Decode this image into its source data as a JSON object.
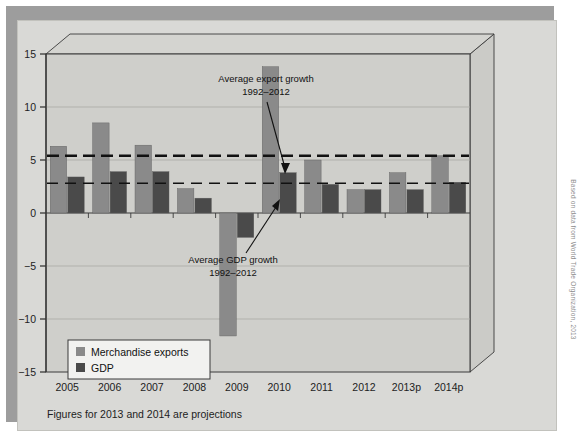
{
  "figure": {
    "note": "Figures for 2013 and 2014 are projections",
    "credit": "Based on data from World Trade Organization, 2013"
  },
  "annotations": {
    "export_growth": {
      "line1": "Average export growth",
      "line2": "1992–2012"
    },
    "gdp_growth": {
      "line1": "Average GDP growth",
      "line2": "1992–2012"
    }
  },
  "legend": {
    "items": [
      {
        "label": "Merchandise exports",
        "color": "#8a8a8a"
      },
      {
        "label": "GDP",
        "color": "#4a4a4a"
      }
    ]
  },
  "colors": {
    "exports": "#8a8a8a",
    "gdp": "#4a4a4a",
    "plot_bg": "#cfcfcb",
    "card_bg": "#d9d9d6",
    "frame_line": "#3a3a3a",
    "grid": "#a9a9a5",
    "reference_line": "#111111"
  },
  "chart_data": {
    "type": "bar",
    "title": "",
    "xlabel": "",
    "ylabel": "",
    "ylim": [
      -15,
      15
    ],
    "yticks": [
      15,
      10,
      5,
      0,
      -5,
      -10,
      -15
    ],
    "ytick_labels": [
      "15",
      "10",
      "5",
      "0",
      "−5",
      "−10",
      "−15"
    ],
    "grid": true,
    "legend_position": "bottom-left",
    "categories": [
      "2005",
      "2006",
      "2007",
      "2008",
      "2009",
      "2010",
      "2011",
      "2012",
      "2013p",
      "2014p"
    ],
    "series": [
      {
        "name": "Merchandise exports",
        "color": "#8a8a8a",
        "values": [
          6.3,
          8.5,
          6.4,
          2.3,
          -11.6,
          13.8,
          5.0,
          2.2,
          3.8,
          5.4
        ]
      },
      {
        "name": "GDP",
        "color": "#4a4a4a",
        "values": [
          3.4,
          3.9,
          3.9,
          1.4,
          -2.3,
          3.8,
          2.7,
          2.2,
          2.2,
          2.9
        ]
      }
    ],
    "reference_lines": [
      {
        "name": "Average export growth 1992–2012",
        "value": 5.4,
        "style": "dashed-thick"
      },
      {
        "name": "Average GDP growth 1992–2012",
        "value": 2.8,
        "style": "dashed-thin"
      }
    ]
  }
}
